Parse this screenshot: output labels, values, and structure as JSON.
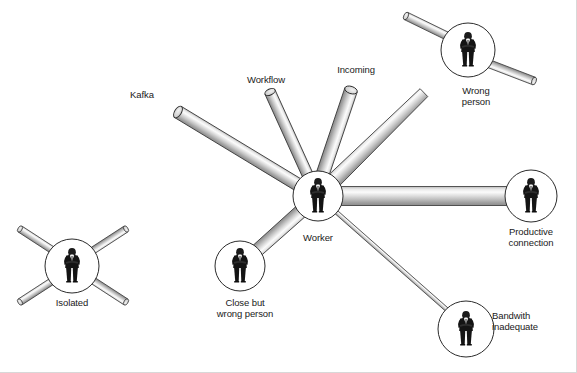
{
  "diagram": {
    "type": "node-link hub and spoke",
    "background_color": "#ffffff",
    "tube_color_light": "#f2f2f2",
    "tube_color_mid": "#c9c9c9",
    "tube_color_dark": "#8a8a8a",
    "outline_color": "#2b2b2b",
    "label_color": "#1a1a1a",
    "nodes": [
      {
        "id": "worker",
        "label": "Worker",
        "icon": "businessman-figure-icon",
        "cx": 318,
        "cy": 196,
        "r": 25,
        "label_x": 318,
        "label_y": 230
      },
      {
        "id": "wrong-person",
        "label": "Wrong\nperson",
        "icon": "businessman-figure-icon",
        "cx": 468,
        "cy": 50,
        "r": 27,
        "label_x": 476,
        "label_y": 89
      },
      {
        "id": "productive-connection",
        "label": "Productive\nconnection",
        "icon": "businessman-figure-icon",
        "cx": 531,
        "cy": 196,
        "r": 26,
        "label_x": 531,
        "label_y": 230
      },
      {
        "id": "bandwith-inadequate",
        "label": "Bandwith\ninadequate",
        "icon": "businessman-figure-icon",
        "cx": 466,
        "cy": 329,
        "r": 28,
        "label_x": 533,
        "label_y": 316
      },
      {
        "id": "close-but-wrong-person",
        "label": "Close but\nwrong person",
        "icon": "businessman-figure-icon",
        "cx": 240,
        "cy": 266,
        "r": 25,
        "label_x": 245,
        "label_y": 301
      },
      {
        "id": "isolated",
        "label": "Isolated",
        "icon": "businessman-figure-icon",
        "cx": 72,
        "cy": 266,
        "r": 27,
        "label_x": 72,
        "label_y": 301
      }
    ],
    "open_tubes": [
      {
        "id": "kafka",
        "label": "Kafka",
        "label_x": 142,
        "label_y": 95,
        "x1": 178,
        "y1": 112,
        "x2": 300,
        "y2": 186,
        "width": 13
      },
      {
        "id": "workflow",
        "label": "Workflow",
        "label_x": 266,
        "label_y": 79,
        "x1": 270,
        "y1": 92,
        "x2": 309,
        "y2": 178,
        "width": 11
      },
      {
        "id": "incoming",
        "label": "Incoming",
        "label_x": 356,
        "label_y": 70,
        "x1": 351,
        "y1": 90,
        "x2": 322,
        "y2": 176,
        "width": 13
      }
    ],
    "connections": [
      {
        "id": "worker-to-wrong-person",
        "from": "worker",
        "to": "wrong-person",
        "width": 11,
        "style": "tapered"
      },
      {
        "id": "worker-to-productive-connection",
        "from": "worker",
        "to": "productive-connection",
        "width": 19,
        "style": "full"
      },
      {
        "id": "worker-to-bandwith-inadequate",
        "from": "worker",
        "to": "bandwith-inadequate",
        "width": 4,
        "style": "thin"
      },
      {
        "id": "worker-to-close-but-wrong-person",
        "from": "worker",
        "to": "close-but-wrong-person",
        "width": 13,
        "style": "broken"
      }
    ],
    "isolated_stubs": [
      {
        "id": "isolated-stub-top-left",
        "x1": 22,
        "y1": 230,
        "x2": 54,
        "y2": 251,
        "width": 7
      },
      {
        "id": "isolated-stub-top-right",
        "x1": 124,
        "y1": 230,
        "x2": 91,
        "y2": 251,
        "width": 7
      },
      {
        "id": "isolated-stub-bottom-left",
        "x1": 22,
        "y1": 301,
        "x2": 54,
        "y2": 281,
        "width": 7
      },
      {
        "id": "isolated-stub-bottom-right",
        "x1": 124,
        "y1": 301,
        "x2": 91,
        "y2": 281,
        "width": 7
      }
    ],
    "wrong_person_stubs": [
      {
        "id": "wrong-person-stub-upper-left",
        "x1": 408,
        "y1": 18,
        "x2": 447,
        "y2": 36,
        "width": 8
      },
      {
        "id": "wrong-person-stub-right",
        "x1": 530,
        "y1": 79,
        "x2": 489,
        "y2": 64,
        "width": 8
      }
    ]
  }
}
